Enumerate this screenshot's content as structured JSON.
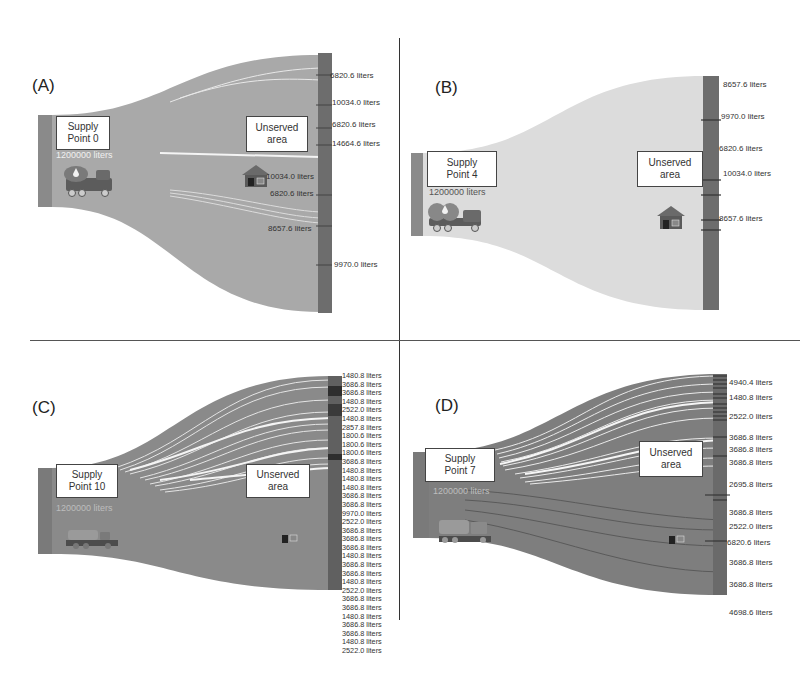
{
  "colors": {
    "flow_gray": "#a9a9a9",
    "flow_light": "#dcdcdc",
    "flow_dark": "#7e7e7e",
    "bar_dark": "#6d6d6d",
    "divider": "#333333"
  },
  "panels": [
    {
      "id": "A",
      "label": "(A)",
      "source": {
        "name_line1": "Supply",
        "name_line2": "Point 0",
        "amount": "1200000 liters",
        "icon": "water-truck-icon"
      },
      "target": {
        "name_line1": "Unserved",
        "name_line2": "area",
        "icon": "house-icon"
      },
      "labels": [
        "6820.6 liters",
        "10034.0 liters",
        "6820.6 liters",
        "14664.6 liters",
        "10034.0 liters",
        "6820.6 liters",
        "8657.6 liters",
        "9970.0 liters"
      ]
    },
    {
      "id": "B",
      "label": "(B)",
      "source": {
        "name_line1": "Supply",
        "name_line2": "Point 4",
        "amount": "1200000 liters",
        "icon": "water-truck-icon"
      },
      "target": {
        "name_line1": "Unserved",
        "name_line2": "area",
        "icon": "house-icon"
      },
      "labels": [
        "8657.6 liters",
        "9970.0 liters",
        "6820.6 liters",
        "10034.0 liters",
        "8657.6 liters"
      ]
    },
    {
      "id": "C",
      "label": "(C)",
      "source": {
        "name_line1": "Supply",
        "name_line2": "Point 10",
        "amount": "1200000 liters",
        "icon": "water-truck-icon"
      },
      "target": {
        "name_line1": "Unserved",
        "name_line2": "area",
        "icon": "house-icon"
      },
      "labels": [
        "1480.8 liters",
        "3686.8 liters",
        "3686.8 liters",
        "1480.8 liters",
        "2522.0 liters",
        "1480.8 liters",
        "2857.8 liters",
        "1800.6 liters",
        "1800.6 liters",
        "1800.6 liters",
        "3686.8 liters",
        "1480.8 liters",
        "1480.8 liters",
        "1480.8 liters",
        "3686.8 liters",
        "3686.8 liters",
        "9970.0 liters",
        "2522.0 liters",
        "3686.8 liters",
        "3686.8 liters",
        "3686.8 liters",
        "1480.8 liters",
        "3686.8 liters",
        "3686.8 liters",
        "1480.8 liters",
        "2522.0 liters",
        "3686.8 liters",
        "3686.8 liters",
        "1480.8 liters",
        "3686.8 liters",
        "3686.8 liters",
        "1480.8 liters",
        "2522.0 liters"
      ]
    },
    {
      "id": "D",
      "label": "(D)",
      "source": {
        "name_line1": "Supply",
        "name_line2": "Point 7",
        "amount": "1200000 liters",
        "icon": "water-truck-icon"
      },
      "target": {
        "name_line1": "Unserved",
        "name_line2": "area",
        "icon": "house-icon"
      },
      "labels": [
        "4940.4 liters",
        "1480.8 liters",
        "2522.0 liters",
        "3686.8 liters",
        "3686.8 liters",
        "3686.8 liters",
        "2695.8 liters",
        "3686.8 liters",
        "2522.0 liters",
        "6820.6 liters",
        "3686.8 liters",
        "3686.8 liters",
        "4698.6 liters"
      ]
    }
  ]
}
